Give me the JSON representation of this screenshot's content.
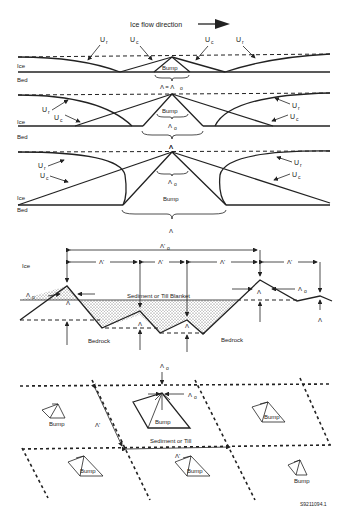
{
  "title": "Ice flow direction",
  "panel1": {
    "labels": {
      "ice": "Ice",
      "bed": "Bed",
      "bump": "Bump",
      "lambda_eq": "Λ = Λ",
      "lambda_sub": "o"
    },
    "u_labels": [
      "U",
      "U",
      "U",
      "U"
    ],
    "u_subs": [
      "r",
      "c",
      "c",
      "r"
    ]
  },
  "panel2": {
    "labels": {
      "ice": "Ice",
      "bed": "Bed",
      "bump": "Bump",
      "lambda_o": "Λ",
      "lambda_o_sub": "o",
      "lambda": "Λ"
    },
    "u_labels": [
      "U",
      "U",
      "U",
      "U"
    ],
    "u_subs": [
      "r",
      "c",
      "r",
      "c"
    ]
  },
  "panel3": {
    "labels": {
      "ice": "Ice",
      "bed": "Bed",
      "bump": "Bump",
      "lambda_o": "Λ",
      "lambda_o_sub": "o",
      "lambda": "Λ",
      "lambda_top": "Λ"
    },
    "u_labels": [
      "U",
      "U",
      "U",
      "U"
    ],
    "u_subs": [
      "r",
      "c",
      "r",
      "c"
    ]
  },
  "panel4": {
    "labels": {
      "ice": "Ice",
      "sediment": "Sediment or Till Blanket",
      "bedrock_left": "Bedrock",
      "bedrock_right": "Bedrock",
      "lambda_prime_o": "Λ'",
      "lambda_prime_o_sub": "o",
      "lambda_prime": "Λ'",
      "lambda": "Λ",
      "lambda_o": "Λ",
      "lambda_o_sub": "o"
    }
  },
  "panel5": {
    "labels": {
      "bump": "Bump",
      "sediment": "Sediment or Till",
      "lambda_prime": "Λ'",
      "lambda_o": "Λ",
      "lambda_o_sub": "o"
    }
  },
  "figure_id": "S9211094.1"
}
